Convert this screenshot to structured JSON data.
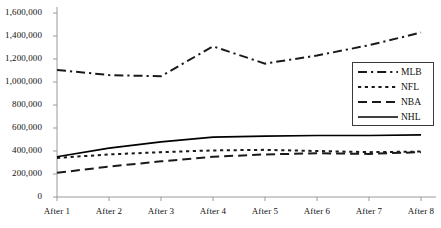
{
  "chart_data": {
    "type": "line",
    "title": "",
    "subtitle": "",
    "xlabel": "",
    "ylabel": "",
    "categories": [
      "After 1",
      "After 2",
      "After 3",
      "After 4",
      "After 5",
      "After 6",
      "After 7",
      "After 8"
    ],
    "series": [
      {
        "name": "MLB",
        "style": "dash-dot",
        "color": "#1a1a1a",
        "values": [
          1105000,
          1060000,
          1050000,
          1310000,
          1160000,
          1230000,
          1320000,
          1430000
        ]
      },
      {
        "name": "NFL",
        "style": "dotted",
        "color": "#1a1a1a",
        "values": [
          340000,
          370000,
          390000,
          405000,
          410000,
          400000,
          390000,
          395000
        ]
      },
      {
        "name": "NBA",
        "style": "dashed",
        "color": "#1a1a1a",
        "values": [
          210000,
          265000,
          310000,
          350000,
          370000,
          380000,
          375000,
          390000
        ]
      },
      {
        "name": "NHL",
        "style": "solid",
        "color": "#000000",
        "values": [
          350000,
          425000,
          480000,
          520000,
          530000,
          535000,
          535000,
          540000
        ]
      }
    ],
    "ylim": [
      0,
      1600000
    ],
    "ytick_values": [
      0,
      200000,
      400000,
      600000,
      800000,
      1000000,
      1200000,
      1400000,
      1600000
    ],
    "ytick_labels": [
      "0",
      "200,000",
      "400,000",
      "600,000",
      "800,000",
      "1,000,000",
      "1,200,000",
      "1,400,000",
      "1,600,000"
    ],
    "grid": false,
    "legend_position": "middle-right",
    "legend_entries": [
      "MLB",
      "NFL",
      "NBA",
      "NHL"
    ]
  },
  "axes": {
    "y_axis_name": "vertical-axis",
    "x_axis_name": "horizontal-axis"
  }
}
